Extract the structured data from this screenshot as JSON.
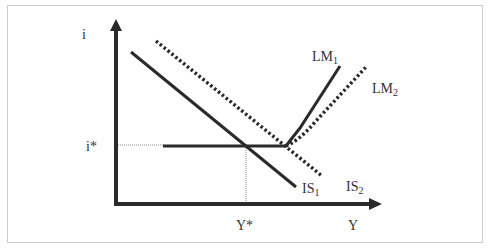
{
  "diagram": {
    "type": "IS-LM liquidity trap diagram",
    "y_axis_label": "i",
    "x_axis_label": "Y",
    "equilibrium_rate_label": "i*",
    "equilibrium_output_label": "Y*",
    "curves": [
      {
        "name": "IS1",
        "base": "IS",
        "sub": "1",
        "style": "solid"
      },
      {
        "name": "IS2",
        "base": "IS",
        "sub": "2",
        "style": "dotted"
      },
      {
        "name": "LM1",
        "base": "LM",
        "sub": "1",
        "style": "solid"
      },
      {
        "name": "LM2",
        "base": "LM",
        "sub": "2",
        "style": "dotted"
      }
    ]
  },
  "labels": {
    "i": "i",
    "i_star": "i*",
    "y_star": "Y*",
    "y": "Y",
    "lm1_base": "LM",
    "lm1_sub": "1",
    "lm2_base": "LM",
    "lm2_sub": "2",
    "is1_base": "IS",
    "is1_sub": "1",
    "is2_base": "IS",
    "is2_sub": "2"
  },
  "colors": {
    "line": "#2a2a2a",
    "guide": "#888888",
    "border": "#cfcfcf"
  }
}
